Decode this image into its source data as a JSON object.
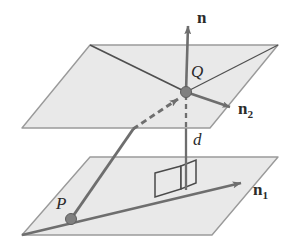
{
  "figure": {
    "colors": {
      "plane_fill": "#e9e9e9",
      "plane_stroke": "#9a9a9a",
      "vector_stroke": "#6e6e6e",
      "point_fill": "#808080",
      "point_stroke": "#5d5d5d",
      "label_color": "#2b2b2b",
      "background": "#ffffff",
      "right_angle_stroke": "#4a4a4a"
    },
    "labels": [
      {
        "id": "normal-n",
        "text": "n",
        "sub": "",
        "style": "vector",
        "x": 197,
        "y": 9,
        "size": 17
      },
      {
        "id": "point-Q",
        "text": "Q",
        "sub": "",
        "style": "point",
        "x": 191,
        "y": 63,
        "size": 17
      },
      {
        "id": "normal-n2",
        "text": "n",
        "sub": "2",
        "style": "vector",
        "x": 238,
        "y": 100,
        "size": 17
      },
      {
        "id": "distance-d",
        "text": "d",
        "sub": "",
        "style": "point",
        "x": 193,
        "y": 131,
        "size": 17
      },
      {
        "id": "normal-n1",
        "text": "n",
        "sub": "1",
        "style": "vector",
        "x": 253,
        "y": 181,
        "size": 17
      },
      {
        "id": "point-P",
        "text": "P",
        "sub": "",
        "style": "point",
        "x": 56,
        "y": 195,
        "size": 17
      }
    ],
    "planes": [
      {
        "id": "upper-plane",
        "points": "90,45 278,45 210,128 22,128"
      },
      {
        "id": "lower-plane",
        "points": "90,157 278,157 212,235 22,235"
      }
    ],
    "points": [
      {
        "id": "point-Q-dot",
        "cx": 186,
        "cy": 92,
        "r": 5.5
      },
      {
        "id": "point-P-dot",
        "cx": 71,
        "cy": 219,
        "r": 5.5
      }
    ],
    "vectors": [
      {
        "id": "normal-n-arrow",
        "x1": 186,
        "y1": 92,
        "x2": 188,
        "y2": 24,
        "dashed": false
      },
      {
        "id": "normal-n2-arrow",
        "x1": 186,
        "y1": 92,
        "x2": 231,
        "y2": 108,
        "dashed": false
      },
      {
        "id": "normal-n1-arrow",
        "x1": 22,
        "y1": 235,
        "x2": 241,
        "y2": 183,
        "dashed": false
      }
    ],
    "plane_ridges": [
      {
        "id": "upper-plane-ridge",
        "x1": 90,
        "y1": 45,
        "x2": 186,
        "y2": 92
      },
      {
        "id": "upper-plane-ridge-right",
        "x1": 186,
        "y1": 92,
        "x2": 278,
        "y2": 45
      }
    ],
    "pq_vector": {
      "id": "pq-vector",
      "solid_x1": 71,
      "solid_y1": 219,
      "solid_x2": 134,
      "solid_y2": 128,
      "dashed_x1": 134,
      "dashed_y1": 128,
      "dashed_x2": 179,
      "dashed_y2": 98,
      "arrow_x": 180,
      "arrow_y": 97
    },
    "distance_line": {
      "id": "distance-line",
      "dashed_x1": 186,
      "dashed_y1": 95,
      "dashed_x2": 186,
      "dashed_y2": 128,
      "solid_x1": 186,
      "solid_y1": 128,
      "solid_x2": 186,
      "solid_y2": 190
    },
    "right_angle_marker": {
      "id": "right-angle-marker",
      "face_a": "155,173 181,166 181,189 155,197",
      "face_b": "181,166 196,160 196,183 181,189"
    }
  }
}
